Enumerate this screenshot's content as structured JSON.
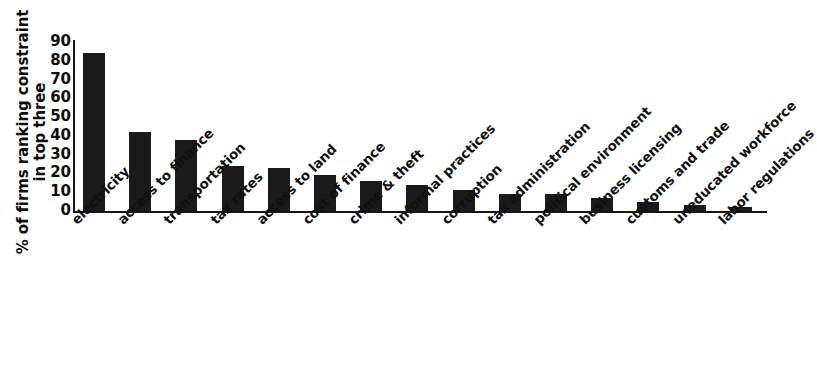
{
  "chart_data": {
    "type": "bar",
    "title": "",
    "subtitle": "",
    "xlabel": "",
    "ylabel": "% of firms ranking constraint in top three",
    "ylabel_lines": [
      "% of firms ranking constraint",
      "in top three"
    ],
    "categories": [
      "electricity",
      "access to finance",
      "transportation",
      "tax rates",
      "access to land",
      "cost of finance",
      "crime & theft",
      "informal practices",
      "corruption",
      "tax administration",
      "political environment",
      "business licensing",
      "customs and trade",
      "uneducated workforce",
      "labor regulations"
    ],
    "values": [
      84,
      42,
      38,
      24,
      23,
      19,
      16,
      14,
      11,
      9,
      9,
      7,
      5,
      3,
      2
    ],
    "ylim": [
      0,
      90
    ],
    "yticks": [
      0,
      10,
      20,
      30,
      40,
      50,
      60,
      70,
      80,
      90
    ],
    "ytick_labels": [
      "0",
      "10",
      "20",
      "30",
      "40",
      "50",
      "60",
      "70",
      "80",
      "90"
    ],
    "grid": false,
    "legend": null,
    "bar_color": "#1a1a1a",
    "axis_color": "#151515",
    "background_color": "#ffffff"
  }
}
